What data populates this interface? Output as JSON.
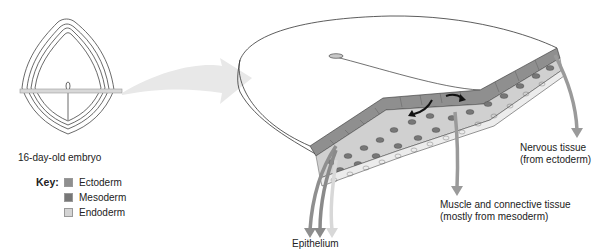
{
  "diagram": {
    "embryo_caption": "16-day-old embryo",
    "key": {
      "title": "Key:",
      "items": [
        {
          "label": "Ectoderm",
          "color": "#8f8f8f"
        },
        {
          "label": "Mesoderm",
          "color": "#777777"
        },
        {
          "label": "Endoderm",
          "color": "#d4d4d4"
        }
      ]
    },
    "labels": {
      "nervous_line1": "Nervous tissue",
      "nervous_line2": "(from ectoderm)",
      "muscle_line1": "Muscle and connective tissue",
      "muscle_line2": "(mostly from mesoderm)",
      "epithelium": "Epithelium"
    },
    "colors": {
      "ectoderm": "#8f8f8f",
      "mesoderm": "#777777",
      "endoderm": "#d4d4d4",
      "arrow": "#9a9a9a",
      "big_arrow": "#e6e6e6",
      "outline": "#333333"
    }
  }
}
